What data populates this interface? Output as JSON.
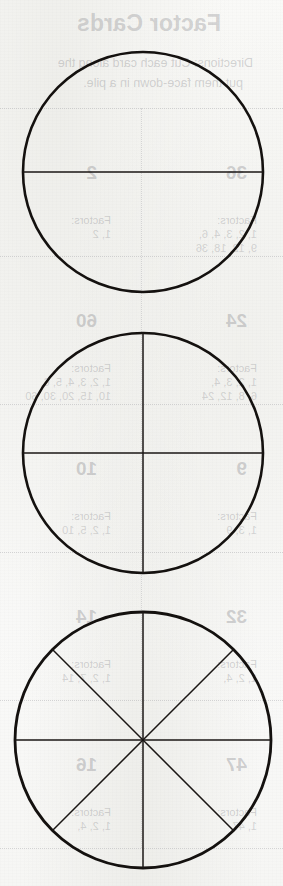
{
  "document": {
    "kind": "scanned-worksheet-page",
    "page_background": "#fbfbfa",
    "ink_color": "#14110f",
    "bleed_ink_color": "#7a7a80"
  },
  "figures": {
    "caption": "Fraction circles",
    "items": [
      {
        "name": "circle-halves",
        "label": "Circle divided into 2 equal parts",
        "center_x": 143,
        "center_y": 172,
        "radius": 120,
        "stroke_width": 2.6,
        "divisions": 2,
        "divider_stroke_width": 1.5,
        "angles_deg": [
          90,
          270
        ]
      },
      {
        "name": "circle-quarters",
        "label": "Circle divided into 4 equal parts",
        "center_x": 143,
        "center_y": 453,
        "radius": 120,
        "stroke_width": 2.6,
        "divisions": 4,
        "divider_stroke_width": 1.5,
        "angles_deg": [
          0,
          90,
          180,
          270
        ]
      },
      {
        "name": "circle-eighths",
        "label": "Circle divided into 8 equal parts",
        "center_x": 143,
        "center_y": 740,
        "radius": 128,
        "stroke_width": 2.8,
        "divisions": 8,
        "divider_stroke_width": 1.5,
        "angles_deg": [
          0,
          45,
          90,
          135,
          180,
          225,
          270,
          315
        ]
      }
    ]
  },
  "bleed_through": {
    "note": "Mirrored show-through from the reverse side of the sheet",
    "title": "Factor Cards",
    "instructions": [
      "Directions: Cut each card along the",
      "put them face-down in a pile."
    ],
    "cards": [
      {
        "number": "36",
        "label": "Factors:",
        "factors_line1": "1, 2, 3, 4, 6,",
        "factors_line2": "9, 12, 18, 36"
      },
      {
        "number": "2",
        "label": "Factors:",
        "factors_line1": "1, 2",
        "factors_line2": ""
      },
      {
        "number": "24",
        "label": "Factors:",
        "factors_line1": "1, 2, 3, 4,",
        "factors_line2": "6, 8, 12, 24"
      },
      {
        "number": "60",
        "label": "Factors:",
        "factors_line1": "1, 2, 3, 4, 5, 6,",
        "factors_line2": "10, 15, 20, 30, 60"
      },
      {
        "number": "9",
        "label": "Factors:",
        "factors_line1": "1, 3, 9",
        "factors_line2": ""
      },
      {
        "number": "10",
        "label": "Factors:",
        "factors_line1": "1, 2, 5, 10",
        "factors_line2": ""
      },
      {
        "number": "32",
        "label": "Factors:",
        "factors_line1": "1, 2, 4,",
        "factors_line2": "8, 16, 32"
      },
      {
        "number": "14",
        "label": "Factors:",
        "factors_line1": "1, 2, 7, 14",
        "factors_line2": ""
      },
      {
        "number": "47",
        "label": "Factors:",
        "factors_line1": "1, 47",
        "factors_line2": ""
      },
      {
        "number": "16",
        "label": "Factors:",
        "factors_line1": "1, 2, 4,",
        "factors_line2": "8, 16"
      }
    ]
  }
}
